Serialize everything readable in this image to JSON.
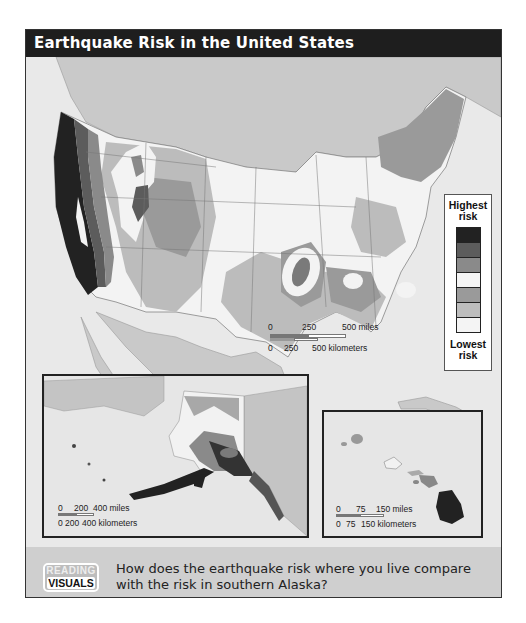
{
  "title": "Earthquake Risk in the United States",
  "legend": {
    "top_label": "Highest risk",
    "bottom_label": "Lowest risk",
    "levels": [
      {
        "rank": 1,
        "color": "#222222"
      },
      {
        "rank": 2,
        "color": "#5c5c5c"
      },
      {
        "rank": 3,
        "color": "#8a8a8a"
      },
      {
        "rank": 4,
        "color": "#f4f4f4"
      },
      {
        "rank": 5,
        "color": "#9a9a9a"
      },
      {
        "rank": 6,
        "color": "#bdbdbd"
      },
      {
        "rank": 7,
        "color": "#f4f4f4"
      }
    ]
  },
  "main_scale": {
    "miles": [
      "0",
      "250",
      "500 miles"
    ],
    "kilometers": [
      "0",
      "250",
      "500 kilometers"
    ]
  },
  "alaska_inset": {
    "scale": {
      "miles": [
        "0",
        "200",
        "400 miles"
      ],
      "kilometers": [
        "0",
        "200",
        "400 kilometers"
      ]
    }
  },
  "hawaii_inset": {
    "scale": {
      "miles": [
        "0",
        "75",
        "150 miles"
      ],
      "kilometers": [
        "0",
        "75",
        "150 kilometers"
      ]
    }
  },
  "reading_visuals": {
    "badge_top": "READING",
    "badge_bottom": "VISUALS",
    "question": "How does the earthquake risk where you live compare with the risk in southern Alaska?"
  },
  "colors": {
    "title_bar": "#1e1e1e",
    "ocean": "#e8e8e8",
    "neighbor_land": "#c8c8c8",
    "highest": "#222222",
    "lowest": "#f4f4f4"
  }
}
